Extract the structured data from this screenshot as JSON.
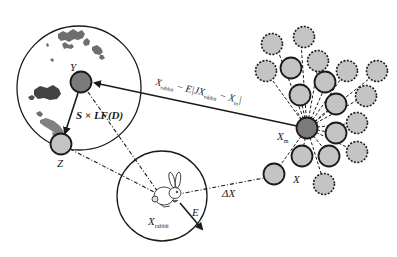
{
  "labels": {
    "y": "Y",
    "z": "Z",
    "x": "X",
    "xm_base": "X",
    "xm_sub": "m",
    "x_rabbit_base": "X",
    "x_rabbit_sub": "rabbit",
    "e": "E",
    "delta_x": "ΔX",
    "step_formula": "S × LF(D)",
    "update_formula_part1_base": "X",
    "update_formula_part1_sub": "rabbit",
    "update_formula_part2": " − E|JX",
    "update_formula_part3_sub": "rabbit",
    "update_formula_part4": " − X",
    "update_formula_part5_sub": "m",
    "update_formula_close": "|"
  },
  "colors": {
    "node_dark": "#7a7a7a",
    "node_light": "#c4c4c4",
    "stroke": "#1a1a1a",
    "cloud": "#555555"
  },
  "icons": {
    "rabbit": "rabbit-icon"
  }
}
